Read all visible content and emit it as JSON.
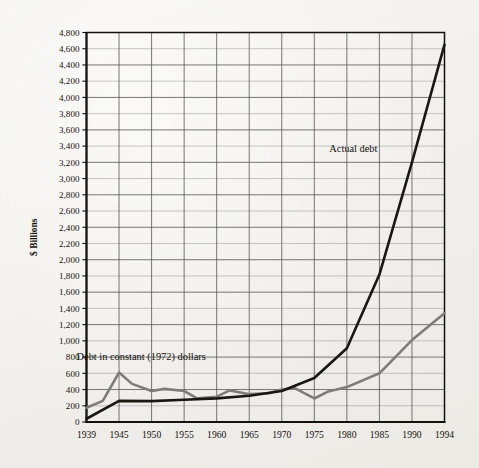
{
  "figure": {
    "background_color": "#f2f1ed",
    "frame_color": "#15110d"
  },
  "chart_data": {
    "type": "line",
    "title": "",
    "xlabel": "",
    "ylabel": "$ Billions",
    "xlim": [
      1939,
      1994
    ],
    "ylim": [
      0,
      4800
    ],
    "y_tick_step": 200,
    "grid": true,
    "legend_position": "inline-annotations",
    "x_tick_labels": [
      "1939",
      "1945",
      "1950",
      "1955",
      "1960",
      "1965",
      "1970",
      "1975",
      "1980",
      "1985",
      "1990",
      "1994"
    ],
    "x_tick_values": [
      1939,
      1945,
      1950,
      1955,
      1960,
      1965,
      1970,
      1975,
      1980,
      1985,
      1990,
      1994
    ],
    "y_tick_labels": [
      "0",
      "200",
      "400",
      "600",
      "800",
      "1,000",
      "1,200",
      "1,400",
      "1,600",
      "1,800",
      "2,000",
      "2,200",
      "2,400",
      "2,600",
      "2,800",
      "3,000",
      "3,200",
      "3,400",
      "3,600",
      "3,800",
      "4,000",
      "4,200",
      "4,400",
      "4,600",
      "4,800"
    ],
    "y_tick_values": [
      0,
      200,
      400,
      600,
      800,
      1000,
      1200,
      1400,
      1600,
      1800,
      2000,
      2200,
      2400,
      2600,
      2800,
      3000,
      3200,
      3400,
      3600,
      3800,
      4000,
      4200,
      4400,
      4600,
      4800
    ],
    "series": [
      {
        "name": "Actual debt",
        "color": "#1a1713",
        "line_width": 2.6,
        "annotation": "Actual debt",
        "annotation_x": 1981.0,
        "annotation_y": 3330,
        "x": [
          1939,
          1945,
          1950,
          1955,
          1960,
          1965,
          1970,
          1975,
          1980,
          1985,
          1990,
          1994
        ],
        "values": [
          40,
          260,
          257,
          274,
          291,
          323,
          381,
          542,
          909,
          1817,
          3200,
          4650
        ]
      },
      {
        "name": "Debt in constant (1972) dollars",
        "color": "#807d79",
        "line_width": 2.6,
        "annotation": "Debt in constant (1972) dollars",
        "annotation_x": 1948.4,
        "annotation_y": 760,
        "x": [
          1939,
          1942,
          1945,
          1947,
          1950,
          1952,
          1955,
          1957,
          1960,
          1962,
          1965,
          1968,
          1970,
          1972,
          1975,
          1977,
          1980,
          1985,
          1990,
          1994
        ],
        "values": [
          175,
          260,
          610,
          470,
          383,
          408,
          382,
          292,
          312,
          390,
          343,
          355,
          400,
          418,
          290,
          372,
          430,
          600,
          1010,
          1340
        ]
      }
    ],
    "annotations": [
      {
        "text": "Actual debt",
        "x": 1981.0,
        "y": 3330
      },
      {
        "text": "Debt in constant (1972) dollars",
        "x": 1948.4,
        "y": 760
      }
    ]
  },
  "axis": {
    "y_title": "$ Billions"
  }
}
